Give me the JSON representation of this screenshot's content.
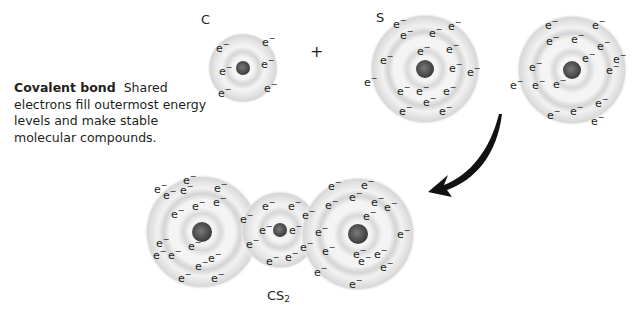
{
  "caption": {
    "title": "Covalent bond",
    "body": "Shared electrons fill outermost energy levels and make stable molecular compounds."
  },
  "reactants": {
    "carbon_label": "C",
    "sulfur_label": "S",
    "plus_sign": "+"
  },
  "product": {
    "formula_main": "CS",
    "formula_subscript": "2"
  },
  "electron_symbol": "e",
  "electron_charge": "−",
  "atoms": [
    {
      "id": "carbon-reactant",
      "element": "C",
      "shells": [
        2,
        4
      ],
      "electrons_shown": 6
    },
    {
      "id": "sulfur-reactant-1",
      "element": "S",
      "shells": [
        2,
        8,
        6
      ],
      "electrons_shown": 16
    },
    {
      "id": "sulfur-reactant-2",
      "element": "S",
      "shells": [
        2,
        8,
        6
      ],
      "electrons_shown": 16
    },
    {
      "id": "sulfur-product-left",
      "element": "S",
      "shells": [
        2,
        8,
        8
      ],
      "electrons_shown": 16
    },
    {
      "id": "carbon-product",
      "element": "C",
      "shells": [
        2,
        8
      ],
      "electrons_shown": 6
    },
    {
      "id": "sulfur-product-right",
      "element": "S",
      "shells": [
        2,
        8,
        8
      ],
      "electrons_shown": 16
    }
  ],
  "colors": {
    "shell": "#d4d4d4",
    "shell_light": "#ececec",
    "nucleus": "#4a4a4a",
    "text": "#231f20",
    "arrow": "#111111"
  }
}
